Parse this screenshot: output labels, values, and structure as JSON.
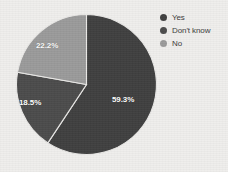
{
  "chart_data": {
    "type": "pie",
    "title": "",
    "categories": [
      "Yes",
      "Don't know",
      "No"
    ],
    "values": [
      59.3,
      18.5,
      22.2
    ],
    "labels": [
      "59.3%",
      "18.5%",
      "22.2%"
    ],
    "colors": [
      "#3f3f3f",
      "#4b4b4b",
      "#9a9a9a"
    ],
    "legend_position": "right",
    "grid": false,
    "units": "percent",
    "background_color": "#efeeec",
    "label_text_color": "#ffffff"
  },
  "legend": {
    "items": [
      {
        "label": "Yes",
        "color": "#3f3f3f",
        "value": "59.3%"
      },
      {
        "label": "Don't know",
        "color": "#4b4b4b",
        "value": "18.5%"
      },
      {
        "label": "No",
        "color": "#9a9a9a",
        "value": "22.2%"
      }
    ]
  },
  "slice_labels": {
    "yes": "59.3%",
    "dont_know": "18.5%",
    "no": "22.2%"
  }
}
